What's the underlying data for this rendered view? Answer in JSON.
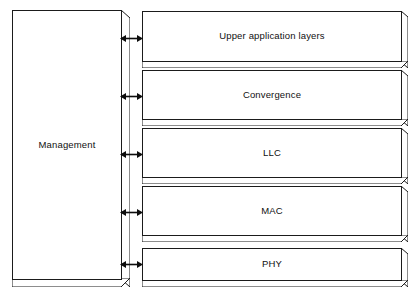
{
  "diagram": {
    "type": "layered-block-diagram",
    "background_color": "#ffffff",
    "line_color": "#1b1b1b",
    "fill_color": "#ffffff",
    "shade_color": "#d9d9d9",
    "management": {
      "label": "Management",
      "orientation": "vertical"
    },
    "layers": [
      {
        "id": "upper-application-layers",
        "label": "Upper application layers"
      },
      {
        "id": "convergence",
        "label": "Convergence"
      },
      {
        "id": "llc",
        "label": "LLC"
      },
      {
        "id": "mac",
        "label": "MAC"
      },
      {
        "id": "phy",
        "label": "PHY"
      }
    ],
    "connectors": [
      {
        "id": "connector-upper-application-layers",
        "kind": "double-headed-arrow"
      },
      {
        "id": "connector-convergence",
        "kind": "double-headed-arrow"
      },
      {
        "id": "connector-llc",
        "kind": "double-headed-arrow"
      },
      {
        "id": "connector-mac",
        "kind": "double-headed-arrow"
      },
      {
        "id": "connector-phy",
        "kind": "double-headed-arrow"
      }
    ]
  }
}
